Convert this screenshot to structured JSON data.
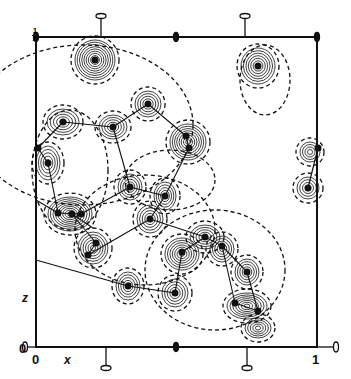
{
  "figure": {
    "type": "electron density contour projection",
    "labels": {
      "x_origin": "0",
      "x_end": "1",
      "x_axis": "x",
      "z_axis": "z",
      "z_origin": "0",
      "z_top_num": "1",
      "z_top_den": "4"
    },
    "frame": {
      "left": 36,
      "top": 37,
      "right": 317,
      "bottom": 347
    },
    "colors": {
      "ink": "#111111",
      "background": "#ffffff"
    },
    "peaks": [
      {
        "x": 95,
        "y": 60,
        "rings": 9,
        "rx": 20,
        "ry": 20
      },
      {
        "x": 258,
        "y": 66,
        "rings": 7,
        "rx": 17,
        "ry": 18
      },
      {
        "x": 63,
        "y": 122,
        "rings": 5,
        "rx": 16,
        "ry": 13
      },
      {
        "x": 113,
        "y": 127,
        "rings": 5,
        "rx": 14,
        "ry": 12
      },
      {
        "x": 148,
        "y": 104,
        "rings": 5,
        "rx": 13,
        "ry": 13
      },
      {
        "x": 48,
        "y": 163,
        "rings": 5,
        "rx": 12,
        "ry": 17
      },
      {
        "x": 188,
        "y": 142,
        "rings": 8,
        "rx": 18,
        "ry": 18
      },
      {
        "x": 130,
        "y": 187,
        "rings": 5,
        "rx": 12,
        "ry": 13
      },
      {
        "x": 165,
        "y": 196,
        "rings": 5,
        "rx": 11,
        "ry": 14
      },
      {
        "x": 310,
        "y": 152,
        "rings": 4,
        "rx": 10,
        "ry": 10
      },
      {
        "x": 308,
        "y": 188,
        "rings": 4,
        "rx": 11,
        "ry": 11
      },
      {
        "x": 70,
        "y": 214,
        "rings": 9,
        "rx": 22,
        "ry": 17
      },
      {
        "x": 150,
        "y": 219,
        "rings": 5,
        "rx": 13,
        "ry": 14
      },
      {
        "x": 93,
        "y": 248,
        "rings": 6,
        "rx": 15,
        "ry": 16
      },
      {
        "x": 205,
        "y": 237,
        "rings": 5,
        "rx": 15,
        "ry": 12
      },
      {
        "x": 182,
        "y": 254,
        "rings": 7,
        "rx": 17,
        "ry": 16
      },
      {
        "x": 222,
        "y": 249,
        "rings": 5,
        "rx": 12,
        "ry": 13
      },
      {
        "x": 128,
        "y": 286,
        "rings": 5,
        "rx": 12,
        "ry": 14
      },
      {
        "x": 175,
        "y": 293,
        "rings": 5,
        "rx": 13,
        "ry": 14
      },
      {
        "x": 247,
        "y": 272,
        "rings": 5,
        "rx": 12,
        "ry": 13
      },
      {
        "x": 247,
        "y": 306,
        "rings": 7,
        "rx": 20,
        "ry": 13
      },
      {
        "x": 258,
        "y": 328,
        "rings": 5,
        "rx": 13,
        "ry": 10
      }
    ],
    "atoms": [
      [
        95,
        60
      ],
      [
        258,
        66
      ],
      [
        63,
        122
      ],
      [
        113,
        127
      ],
      [
        148,
        104
      ],
      [
        38,
        148
      ],
      [
        48,
        163
      ],
      [
        186,
        136
      ],
      [
        189,
        148
      ],
      [
        130,
        187
      ],
      [
        165,
        196
      ],
      [
        318,
        148
      ],
      [
        308,
        188
      ],
      [
        58,
        213
      ],
      [
        72,
        214
      ],
      [
        81,
        214
      ],
      [
        150,
        219
      ],
      [
        96,
        243
      ],
      [
        88,
        255
      ],
      [
        205,
        237
      ],
      [
        222,
        246
      ],
      [
        182,
        252
      ],
      [
        247,
        272
      ],
      [
        128,
        286
      ],
      [
        175,
        293
      ],
      [
        235,
        303
      ],
      [
        258,
        311
      ]
    ],
    "bonds": [
      [
        [
          38,
          148
        ],
        [
          63,
          122
        ]
      ],
      [
        [
          63,
          122
        ],
        [
          113,
          127
        ]
      ],
      [
        [
          113,
          127
        ],
        [
          148,
          104
        ]
      ],
      [
        [
          148,
          104
        ],
        [
          186,
          136
        ]
      ],
      [
        [
          186,
          136
        ],
        [
          189,
          148
        ]
      ],
      [
        [
          113,
          127
        ],
        [
          130,
          187
        ]
      ],
      [
        [
          38,
          148
        ],
        [
          48,
          163
        ]
      ],
      [
        [
          48,
          163
        ],
        [
          58,
          213
        ]
      ],
      [
        [
          130,
          187
        ],
        [
          165,
          196
        ]
      ],
      [
        [
          165,
          196
        ],
        [
          150,
          219
        ]
      ],
      [
        [
          165,
          196
        ],
        [
          189,
          148
        ]
      ],
      [
        [
          36,
          200
        ],
        [
          58,
          213
        ]
      ],
      [
        [
          81,
          214
        ],
        [
          130,
          187
        ]
      ],
      [
        [
          58,
          213
        ],
        [
          81,
          214
        ]
      ],
      [
        [
          72,
          214
        ],
        [
          96,
          243
        ]
      ],
      [
        [
          96,
          243
        ],
        [
          88,
          255
        ]
      ],
      [
        [
          88,
          255
        ],
        [
          150,
          219
        ]
      ],
      [
        [
          150,
          219
        ],
        [
          205,
          237
        ]
      ],
      [
        [
          205,
          237
        ],
        [
          222,
          246
        ]
      ],
      [
        [
          205,
          237
        ],
        [
          182,
          252
        ]
      ],
      [
        [
          222,
          246
        ],
        [
          247,
          272
        ]
      ],
      [
        [
          182,
          252
        ],
        [
          175,
          293
        ]
      ],
      [
        [
          128,
          286
        ],
        [
          175,
          293
        ]
      ],
      [
        [
          247,
          272
        ],
        [
          258,
          311
        ]
      ],
      [
        [
          235,
          303
        ],
        [
          258,
          311
        ]
      ],
      [
        [
          222,
          246
        ],
        [
          235,
          303
        ]
      ],
      [
        [
          318,
          148
        ],
        [
          308,
          188
        ]
      ],
      [
        [
          36,
          260
        ],
        [
          128,
          286
        ]
      ],
      [
        [
          72,
          214
        ],
        [
          93,
          228
        ]
      ]
    ],
    "dashed_regions": [
      {
        "x": 83,
        "y": 125,
        "rx": 110,
        "ry": 80
      },
      {
        "x": 170,
        "y": 180,
        "rx": 45,
        "ry": 30
      },
      {
        "x": 145,
        "y": 230,
        "rx": 70,
        "ry": 55
      },
      {
        "x": 215,
        "y": 270,
        "rx": 70,
        "ry": 60
      },
      {
        "x": 70,
        "y": 170,
        "rx": 38,
        "ry": 60
      },
      {
        "x": 265,
        "y": 80,
        "rx": 25,
        "ry": 35
      }
    ]
  }
}
